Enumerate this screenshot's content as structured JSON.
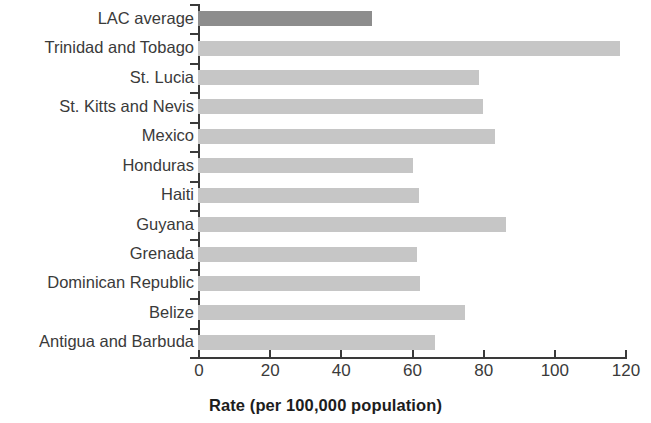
{
  "chart_data": {
    "type": "bar",
    "orientation": "horizontal",
    "title": "",
    "xlabel": "Rate (per 100,000 population)",
    "ylabel": "",
    "xlim": [
      0,
      120
    ],
    "xticks": [
      0,
      20,
      40,
      60,
      80,
      100,
      120
    ],
    "xtick_labels": [
      "0",
      "20",
      "40",
      "60",
      "80",
      "100",
      "120"
    ],
    "grid": false,
    "legend": null,
    "categories": [
      "LAC average",
      "Trinidad and Tobago",
      "St. Lucia",
      "St. Kitts and Nevis",
      "Mexico",
      "Honduras",
      "Haiti",
      "Guyana",
      "Grenada",
      "Dominican Republic",
      "Belize",
      "Antigua and Barbuda"
    ],
    "values": [
      49,
      118.5,
      79,
      80,
      83.5,
      60.5,
      62,
      86.5,
      61.5,
      62.5,
      75,
      66.5
    ],
    "bar_colors": [
      "#8d8d8d",
      "#c6c6c6",
      "#c6c6c6",
      "#c6c6c6",
      "#c6c6c6",
      "#c6c6c6",
      "#c6c6c6",
      "#c6c6c6",
      "#c6c6c6",
      "#c6c6c6",
      "#c6c6c6",
      "#c6c6c6"
    ],
    "highlight_category": "LAC average",
    "colors": {
      "bar": "#c6c6c6",
      "accent_bar": "#8d8d8d",
      "axis": "#3a3a3a",
      "text": "#2b2b2b"
    }
  }
}
